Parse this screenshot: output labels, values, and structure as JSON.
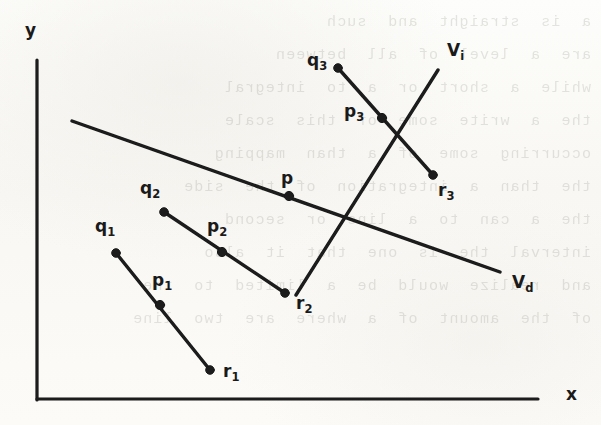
{
  "figure": {
    "kind": "line-diagram",
    "background_note": "scanned page with faint mirrored show-through text",
    "ink_color": "#1a1a1a",
    "paper_color": "#fbfbf9",
    "axes": {
      "y_label": "y",
      "x_label": "x",
      "y_axis": {
        "x": 37,
        "y_top": 60,
        "y_bottom": 400
      },
      "x_axis": {
        "y": 399,
        "x_left": 37,
        "x_right": 538
      },
      "y_label_pos": {
        "x": 25,
        "y": 20
      },
      "x_label_pos": {
        "x": 566,
        "y": 384
      }
    },
    "lines": [
      {
        "name": "Vd",
        "label": "V",
        "sub": "d",
        "label_pos": {
          "x": 512,
          "y": 272
        },
        "from": {
          "x": 72,
          "y": 121
        },
        "to": {
          "x": 500,
          "y": 272
        }
      },
      {
        "name": "Vi",
        "label": "V",
        "sub": "i",
        "label_pos": {
          "x": 447,
          "y": 40
        },
        "from": {
          "x": 296,
          "y": 295
        },
        "to": {
          "x": 438,
          "y": 70
        }
      }
    ],
    "intersection_points": [
      {
        "name": "p",
        "label": "p",
        "sub": "",
        "x": 289,
        "y": 196,
        "label_pos": {
          "x": 281,
          "y": 168
        }
      },
      {
        "name": "p1",
        "label": "p",
        "sub": "1",
        "x": 160,
        "y": 305,
        "label_pos": {
          "x": 152,
          "y": 270
        }
      },
      {
        "name": "p2",
        "label": "p",
        "sub": "2",
        "x": 222,
        "y": 252,
        "label_pos": {
          "x": 207,
          "y": 216
        }
      },
      {
        "name": "p3",
        "label": "p",
        "sub": "3",
        "x": 382,
        "y": 118,
        "label_pos": {
          "x": 344,
          "y": 101
        }
      }
    ],
    "segments": [
      {
        "name": "segment-1",
        "q": {
          "label": "q",
          "sub": "1",
          "x": 116,
          "y": 253,
          "label_pos": {
            "x": 95,
            "y": 216
          }
        },
        "p": {
          "label": "p",
          "sub": "1",
          "x": 160,
          "y": 305
        },
        "r": {
          "label": "r",
          "sub": "1",
          "x": 210,
          "y": 370,
          "label_pos": {
            "x": 223,
            "y": 361
          }
        }
      },
      {
        "name": "segment-2",
        "q": {
          "label": "q",
          "sub": "2",
          "x": 164,
          "y": 212,
          "label_pos": {
            "x": 140,
            "y": 178
          }
        },
        "p": {
          "label": "p",
          "sub": "2",
          "x": 222,
          "y": 252
        },
        "r": {
          "label": "r",
          "sub": "2",
          "x": 285,
          "y": 293,
          "label_pos": {
            "x": 296,
            "y": 293
          }
        }
      },
      {
        "name": "segment-3",
        "q": {
          "label": "q",
          "sub": "3",
          "x": 338,
          "y": 68,
          "label_pos": {
            "x": 307,
            "y": 50
          }
        },
        "p": {
          "label": "p",
          "sub": "3",
          "x": 382,
          "y": 118
        },
        "r": {
          "label": "r",
          "sub": "3",
          "x": 433,
          "y": 175,
          "label_pos": {
            "x": 438,
            "y": 180
          }
        }
      }
    ],
    "showthrough_lines": [
      "a  is  straight  and  such",
      "are  a  level  of  all  between",
      "while  a  short  or  a  to  integral",
      "the  a  write  some  of  this  scale",
      "occurring  some  of  a  than  mapping",
      "the  than  a  integration  of  the  side",
      "the  a  can  to  a  line  or  second",
      "interval  the  is  one  that  it  also",
      "and  realize  would  be  a  limited  to  the",
      "of  the  amount  of  a  where  are  two  line"
    ]
  }
}
